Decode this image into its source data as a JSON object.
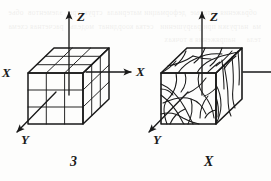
{
  "figure": {
    "type": "technical-line-drawing",
    "background_color": "#ffffff",
    "line_color": "#1a1a1a",
    "bleed_through_text": "  ображения которые  деформации материала  структуры  элементов  обьема  нагрузки при разрушении   сетка координат  модель   расчетная схема тела     напряжения в точках",
    "panels": [
      {
        "id": "left",
        "caption": "3",
        "box_kind": "regular-grid",
        "grid_divisions": 3,
        "axes": [
          {
            "name": "Z",
            "label": "Z",
            "direction": "up"
          },
          {
            "name": "X-left",
            "label": "X",
            "direction": "left"
          },
          {
            "name": "X-right",
            "label": "X",
            "direction": "right"
          },
          {
            "name": "Y",
            "label": "Y",
            "direction": "down-left"
          }
        ]
      },
      {
        "id": "right",
        "caption": "X",
        "box_kind": "irregular-crack-pattern",
        "axes": [
          {
            "name": "Z",
            "label": "Z",
            "direction": "up"
          },
          {
            "name": "X-right",
            "label": "",
            "direction": "right"
          },
          {
            "name": "Y",
            "label": "Y",
            "direction": "down-left"
          }
        ]
      }
    ],
    "labels": {
      "left_z": "Z",
      "left_x_left": "X",
      "left_x_right": "X",
      "left_y": "Y",
      "left_caption": "3",
      "right_z": "Z",
      "right_y": "Y",
      "right_caption": "X"
    }
  }
}
